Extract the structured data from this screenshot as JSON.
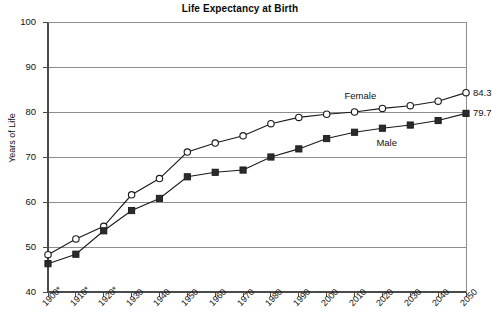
{
  "chart_data": {
    "type": "line",
    "title": "Life Expectancy at Birth",
    "xlabel": "",
    "ylabel": "Years of Life",
    "ylim": [
      40,
      100
    ],
    "ytick_step": 10,
    "yticks": [
      40,
      50,
      60,
      70,
      80,
      90,
      100
    ],
    "grid": true,
    "grid_axis": "y",
    "legend_position": "inline-annotation",
    "categories": [
      "1900*",
      "1910*",
      "1920*",
      "1930",
      "1940",
      "1950",
      "1960",
      "1970",
      "1980",
      "1990",
      "2000",
      "2010",
      "2020",
      "2030",
      "2040",
      "2050"
    ],
    "x": [
      1900,
      1910,
      1920,
      1930,
      1940,
      1950,
      1960,
      1970,
      1980,
      1990,
      2000,
      2010,
      2020,
      2030,
      2040,
      2050
    ],
    "series": [
      {
        "name": "Female",
        "marker": "open-circle",
        "values": [
          48.3,
          51.8,
          54.6,
          61.6,
          65.2,
          71.1,
          73.1,
          74.7,
          77.4,
          78.8,
          79.5,
          80.0,
          80.8,
          81.4,
          82.4,
          84.3
        ]
      },
      {
        "name": "Male",
        "marker": "filled-square",
        "values": [
          46.3,
          48.4,
          53.6,
          58.1,
          60.8,
          65.6,
          66.6,
          67.1,
          70.0,
          71.8,
          74.1,
          75.5,
          76.4,
          77.1,
          78.1,
          79.7
        ]
      }
    ],
    "annotations": [
      {
        "text": "Female",
        "kind": "series-label",
        "series": "Female"
      },
      {
        "text": "Male",
        "kind": "series-label",
        "series": "Male"
      },
      {
        "text": "84.3",
        "kind": "endpoint-value",
        "series": "Female",
        "x": 2050
      },
      {
        "text": "79.7",
        "kind": "endpoint-value",
        "series": "Male",
        "x": 2050
      }
    ]
  },
  "axes": {
    "y_title": "Years of Life",
    "y_labels": [
      "100",
      "90",
      "80",
      "70",
      "60",
      "50",
      "40"
    ],
    "x_labels": [
      "1900*",
      "1910*",
      "1920*",
      "1930",
      "1940",
      "1950",
      "1960",
      "1970",
      "1980",
      "1990",
      "2000",
      "2010",
      "2020",
      "2030",
      "2040",
      "2050"
    ]
  },
  "labels": {
    "female": "Female",
    "male": "Male",
    "female_end_value": "84.3",
    "male_end_value": "79.7"
  },
  "colors": {
    "line": "#1a1a1a",
    "grid": "#8d8d8d",
    "frame": "#4a4a4a",
    "marker_fill_female": "#ffffff",
    "marker_fill_male": "#2b2b2b",
    "background": "#ffffff"
  }
}
